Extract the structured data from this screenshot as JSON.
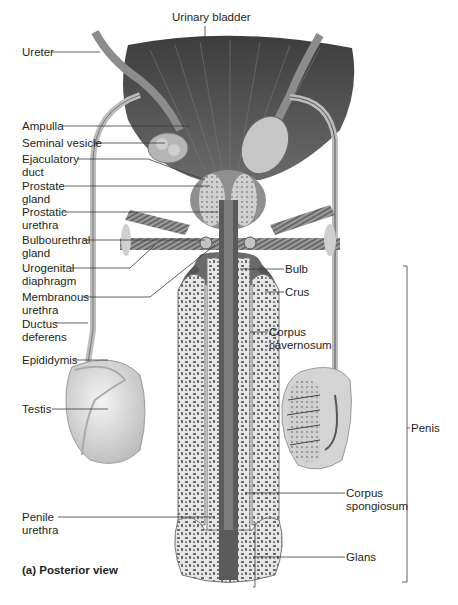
{
  "figure": {
    "panel_caption": "(a) Posterior view",
    "labels": {
      "urinary_bladder": "Urinary bladder",
      "ureter": "Ureter",
      "ampulla": "Ampulla",
      "seminal_vesicle": "Seminal vesicle",
      "ejaculatory_duct": "Ejaculatory\nduct",
      "prostate_gland": "Prostate\ngland",
      "prostatic_urethra": "Prostatic\nurethra",
      "bulbourethral_gland": "Bulbourethral\ngland",
      "urogenital_diaphragm": "Urogenital\ndiaphragm",
      "membranous_urethra": "Membranous\nurethra",
      "ductus_deferens": "Ductus\ndeferens",
      "epididymis": "Epididymis",
      "testis": "Testis",
      "penile_urethra": "Penile\nurethra",
      "bulb": "Bulb",
      "crus": "Crus",
      "corpus_cavernosum": "Corpus\ncavernosum",
      "corpus_spongiosum": "Corpus\nspongiosum",
      "glans": "Glans",
      "penis": "Penis"
    },
    "colors": {
      "bladder": "#5a5a5a",
      "tissue_light": "#d9d9d9",
      "tissue_mid": "#a8a8a8",
      "tissue_dark": "#4a4a4a",
      "leader_line": "#3a3a3a"
    }
  }
}
